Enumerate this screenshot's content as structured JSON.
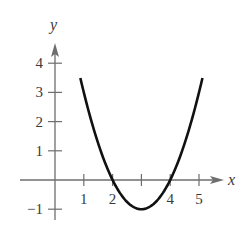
{
  "chart_data": {
    "type": "line",
    "title": "",
    "xlabel": "x",
    "ylabel": "y",
    "function": "y = (x - 3)^2 - 1",
    "xlim": [
      -0.6,
      5.8
    ],
    "ylim": [
      -1.5,
      4.9
    ],
    "x_ticks": [
      1,
      2,
      3,
      4,
      5
    ],
    "x_tick_labels": [
      "1",
      "2",
      "",
      "4",
      "5"
    ],
    "y_ticks": [
      -1,
      1,
      2,
      3,
      4
    ],
    "y_tick_labels": [
      "−1",
      "1",
      "2",
      "3",
      "4"
    ],
    "grid": false,
    "legend": null,
    "series": [
      {
        "name": "parabola",
        "x": [
          0.88,
          1,
          1.5,
          2,
          2.5,
          3,
          3.5,
          4,
          4.5,
          5,
          5.12
        ],
        "y": [
          3.49,
          3,
          1.25,
          0,
          -0.75,
          -1,
          -0.75,
          0,
          1.25,
          3,
          3.49
        ]
      }
    ],
    "key_points": {
      "vertex": [
        3,
        -1
      ],
      "x_intercepts": [
        2,
        4
      ]
    },
    "colors": {
      "curve": "#111111",
      "axes": "#6e6e6e",
      "text": "#3a3a3a"
    }
  },
  "axes": {
    "x_label": "x",
    "y_label": "y"
  },
  "labels": {
    "x": [
      "1",
      "2",
      "4",
      "5"
    ],
    "y": [
      "4",
      "3",
      "2",
      "1",
      "−1"
    ]
  }
}
